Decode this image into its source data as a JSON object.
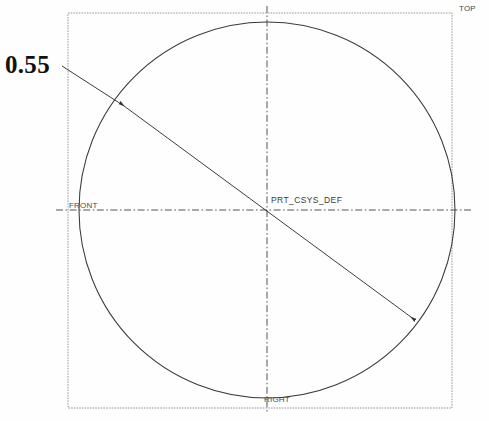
{
  "drawing": {
    "background_color": "#fefefe",
    "frame": {
      "name": "view-border",
      "x": 68,
      "y": 13,
      "width": 384,
      "height": 395,
      "color": "#9a9a9a"
    },
    "circle": {
      "name": "main-circle",
      "cx": 267,
      "cy": 210,
      "r": 188,
      "color": "#3a3a3a"
    },
    "centerlines": {
      "color": "#555555",
      "horizontal": {
        "x1": 56,
        "y1": 210,
        "x2": 472,
        "y2": 210
      },
      "vertical": {
        "x1": 267,
        "y1": 6,
        "x2": 267,
        "y2": 414
      }
    },
    "dimension": {
      "value": "0.55",
      "text_x": 5,
      "text_y": 52,
      "leader": {
        "x1": 62,
        "y1": 66,
        "x2": 120,
        "y2": 103
      },
      "line": {
        "x1": 120,
        "y1": 103,
        "x2": 415,
        "y2": 320
      },
      "arrow_start": {
        "x": 120,
        "y": 103
      },
      "arrow_end": {
        "x": 415,
        "y": 320
      },
      "color": "#333333"
    },
    "labels": [
      {
        "name": "datum-label-top",
        "text": "TOP",
        "x": 459,
        "y": 5
      },
      {
        "name": "datum-label-front",
        "text": "FRONT",
        "x": 69,
        "y": 202
      },
      {
        "name": "datum-label-right",
        "text": "RIGHT",
        "x": 264,
        "y": 396
      }
    ],
    "csys": {
      "name": "PRT_CSYS_DEF",
      "x": 271,
      "y": 196
    }
  }
}
